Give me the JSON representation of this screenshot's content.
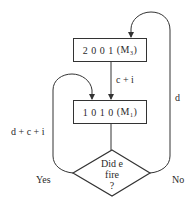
{
  "diagram": {
    "type": "flowchart",
    "nodes": {
      "state_top": {
        "code": "2 0 0 1",
        "label_prefix": "(M",
        "subscript": "3",
        "label_suffix": ")"
      },
      "state_bottom": {
        "code": "1 0 1 0",
        "label_prefix": "(M",
        "subscript": "1",
        "label_suffix": ")"
      },
      "decision": {
        "line1": "Did e",
        "line2": "fire",
        "line3": "?"
      }
    },
    "edges": {
      "top_to_bottom": "c + i",
      "yes_loop": "d + c + i",
      "no_loop": "d"
    },
    "branch_labels": {
      "yes": "Yes",
      "no": "No"
    },
    "colors": {
      "line": "#333333",
      "text": "#2a2a2a",
      "background": "#ffffff"
    }
  }
}
